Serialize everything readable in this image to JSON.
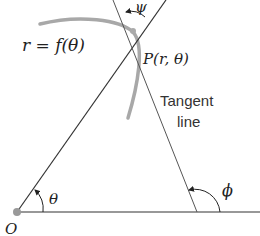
{
  "diagram": {
    "curve_label": "r = f(θ)",
    "point_label": "P(r, θ)",
    "tangent_label_line1": "Tangent",
    "tangent_label_line2": "line",
    "angle_psi": "ψ",
    "angle_theta": "θ",
    "angle_phi": "ϕ",
    "origin_label": "O",
    "colors": {
      "curve": "#a8a8a8",
      "lines": "#333333",
      "tangent": "#555555",
      "origin_dot": "#999999"
    }
  }
}
